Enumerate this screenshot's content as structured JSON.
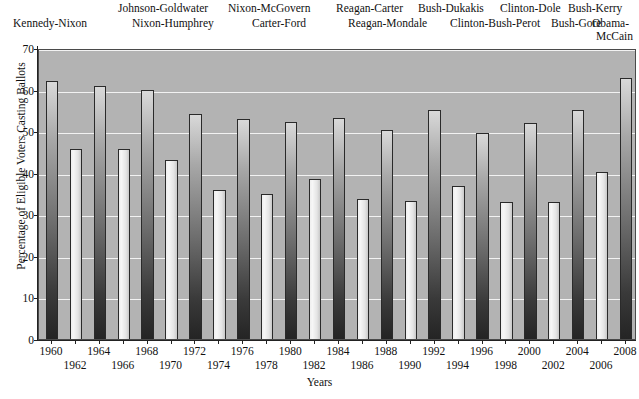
{
  "chart_data": {
    "type": "bar",
    "title": "",
    "xlabel": "Years",
    "ylabel": "Percentage of Eligible Voters Casting Ballots",
    "ylim": [
      0,
      70
    ],
    "yticks": [
      0,
      10,
      20,
      30,
      40,
      50,
      60,
      70
    ],
    "grid": true,
    "legend": "none",
    "categories": [
      "1960",
      "1962",
      "1964",
      "1966",
      "1968",
      "1970",
      "1972",
      "1974",
      "1976",
      "1978",
      "1980",
      "1982",
      "1984",
      "1986",
      "1988",
      "1990",
      "1992",
      "1994",
      "1996",
      "1998",
      "2000",
      "2002",
      "2004",
      "2006",
      "2008"
    ],
    "values": [
      62,
      45.6,
      60.8,
      45.8,
      60,
      43,
      54.2,
      35.8,
      53,
      35,
      52.3,
      38.4,
      53.2,
      33.6,
      50.3,
      33.2,
      55.1,
      36.8,
      49.5,
      33,
      52,
      33,
      55,
      40.2,
      62.8
    ],
    "series_note": "Alternating shading: presidential election years shown dark, midterm election years shown light",
    "bar_styles": [
      "dark",
      "light",
      "dark",
      "light",
      "dark",
      "light",
      "dark",
      "light",
      "dark",
      "light",
      "dark",
      "light",
      "dark",
      "light",
      "dark",
      "light",
      "dark",
      "light",
      "dark",
      "light",
      "dark",
      "light",
      "dark",
      "light",
      "dark"
    ],
    "annotations": [
      "Kennedy-Nixon",
      "Johnson-Goldwater",
      "Nixon-Humphrey",
      "Nixon-McGovern",
      "Carter-Ford",
      "Reagan-Carter",
      "Reagan-Mondale",
      "Bush-Dukakis",
      "Clinton-Bush-Perot",
      "Clinton-Dole",
      "Bush-Gore",
      "Bush-Kerry",
      "Obama-McCain"
    ]
  },
  "top_labels": {
    "row_upper": [
      {
        "text": "Johnson-Goldwater",
        "x": 118
      },
      {
        "text": "Nixon-McGovern",
        "x": 225
      },
      {
        "text": "Reagan-Carter",
        "x": 327
      },
      {
        "text": "Bush-Dukakis",
        "x": 419
      },
      {
        "text": "Clinton-Dole",
        "x": 505
      },
      {
        "text": "Bush-Kerry",
        "x": 573
      }
    ],
    "row_lower": [
      {
        "text": "Kennedy-Nixon",
        "x": 58
      },
      {
        "text": "Nixon-Humphrey",
        "x": 168
      },
      {
        "text": "Carter-Ford",
        "x": 268
      },
      {
        "text": "Reagan-Mondale",
        "x": 362
      },
      {
        "text": "Clinton-Bush-Perot",
        "x": 463
      },
      {
        "text": "Bush-Gore",
        "x": 545
      }
    ],
    "corner": {
      "line1": "Obama-",
      "line2": "McCain"
    }
  },
  "axes": {
    "y_title": "Percentage of Eligible Voters Casting Ballots",
    "x_title": "Years",
    "y_ticks": [
      "70",
      "60",
      "50",
      "40",
      "30",
      "20",
      "10",
      "0"
    ],
    "x_ticks_row_upper": [
      "1960",
      "1964",
      "1968",
      "1972",
      "1976",
      "1980",
      "1984",
      "1988",
      "1992",
      "1996",
      "2000",
      "2004",
      "2008"
    ],
    "x_ticks_row_lower": [
      "1962",
      "1966",
      "1970",
      "1974",
      "1978",
      "1982",
      "1986",
      "1990",
      "1994",
      "1998",
      "2002",
      "2006"
    ]
  },
  "colors": {
    "plot_background": "#b3b3b3",
    "gridline": "#f2f2f2",
    "bar_light": "#ececec",
    "bar_dark": "#3a3a3a",
    "axis": "#222222",
    "text": "#111111"
  }
}
